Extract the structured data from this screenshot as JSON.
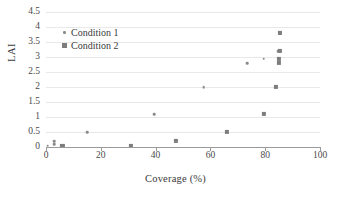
{
  "chart_data": {
    "type": "scatter",
    "title": "",
    "xlabel": "Coverage (%)",
    "ylabel": "LAI",
    "xlim": [
      0,
      100
    ],
    "ylim": [
      0,
      4.5
    ],
    "xticks": [
      "0",
      "20",
      "40",
      "60",
      "80",
      "100"
    ],
    "yticks": [
      "0",
      "0.5",
      "1",
      "1.5",
      "2",
      "2.5",
      "3",
      "3.5",
      "4",
      "4.5"
    ],
    "grid": "horizontal",
    "legend_position": "upper-left-inside",
    "series": [
      {
        "name": "Condition 1",
        "marker": "circle",
        "color": "#8a8a8a",
        "points": [
          {
            "x": 0.6,
            "y": 0.05
          },
          {
            "x": 3.0,
            "y": 0.2
          },
          {
            "x": 3.0,
            "y": 0.1
          },
          {
            "x": 15.0,
            "y": 0.5
          },
          {
            "x": 39.5,
            "y": 1.1
          },
          {
            "x": 57.5,
            "y": 2.0
          },
          {
            "x": 73.5,
            "y": 2.8
          },
          {
            "x": 79.5,
            "y": 2.95
          },
          {
            "x": 84.5,
            "y": 3.2
          },
          {
            "x": 85.5,
            "y": 3.8
          }
        ]
      },
      {
        "name": "Condition 2",
        "marker": "square",
        "color": "#7d7d7d",
        "points": [
          {
            "x": 6.0,
            "y": 0.05
          },
          {
            "x": 31.0,
            "y": 0.05
          },
          {
            "x": 47.5,
            "y": 0.2
          },
          {
            "x": 66.0,
            "y": 0.5
          },
          {
            "x": 79.5,
            "y": 1.1
          },
          {
            "x": 84.0,
            "y": 2.0
          },
          {
            "x": 85.0,
            "y": 2.8
          },
          {
            "x": 85.0,
            "y": 2.95
          },
          {
            "x": 85.5,
            "y": 3.2
          },
          {
            "x": 85.5,
            "y": 3.8
          }
        ]
      }
    ]
  },
  "legend": {
    "items": [
      {
        "label": "Condition 1"
      },
      {
        "label": "Condition 2"
      }
    ]
  }
}
